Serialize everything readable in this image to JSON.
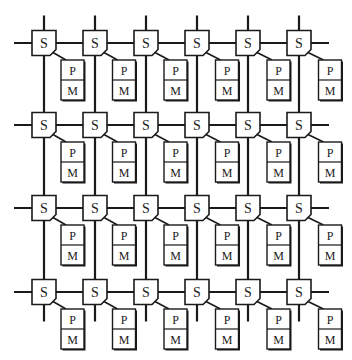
{
  "diagram": {
    "type": "mesh-interconnect",
    "rows": 4,
    "columns": 6,
    "switch_label": "S",
    "processor_label": "P",
    "memory_label": "M",
    "nodes": [
      {
        "row": 1,
        "col": 1,
        "switch": "S",
        "processor": "P",
        "memory": "M"
      },
      {
        "row": 1,
        "col": 2,
        "switch": "S",
        "processor": "P",
        "memory": "M"
      },
      {
        "row": 1,
        "col": 3,
        "switch": "S",
        "processor": "P",
        "memory": "M"
      },
      {
        "row": 1,
        "col": 4,
        "switch": "S",
        "processor": "P",
        "memory": "M"
      },
      {
        "row": 1,
        "col": 5,
        "switch": "S",
        "processor": "P",
        "memory": "M"
      },
      {
        "row": 1,
        "col": 6,
        "switch": "S",
        "processor": "P",
        "memory": "M"
      },
      {
        "row": 2,
        "col": 1,
        "switch": "S",
        "processor": "P",
        "memory": "M"
      },
      {
        "row": 2,
        "col": 2,
        "switch": "S",
        "processor": "P",
        "memory": "M"
      },
      {
        "row": 2,
        "col": 3,
        "switch": "S",
        "processor": "P",
        "memory": "M"
      },
      {
        "row": 2,
        "col": 4,
        "switch": "S",
        "processor": "P",
        "memory": "M"
      },
      {
        "row": 2,
        "col": 5,
        "switch": "S",
        "processor": "P",
        "memory": "M"
      },
      {
        "row": 2,
        "col": 6,
        "switch": "S",
        "processor": "P",
        "memory": "M"
      },
      {
        "row": 3,
        "col": 1,
        "switch": "S",
        "processor": "P",
        "memory": "M"
      },
      {
        "row": 3,
        "col": 2,
        "switch": "S",
        "processor": "P",
        "memory": "M"
      },
      {
        "row": 3,
        "col": 3,
        "switch": "S",
        "processor": "P",
        "memory": "M"
      },
      {
        "row": 3,
        "col": 4,
        "switch": "S",
        "processor": "P",
        "memory": "M"
      },
      {
        "row": 3,
        "col": 5,
        "switch": "S",
        "processor": "P",
        "memory": "M"
      },
      {
        "row": 3,
        "col": 6,
        "switch": "S",
        "processor": "P",
        "memory": "M"
      },
      {
        "row": 4,
        "col": 1,
        "switch": "S",
        "processor": "P",
        "memory": "M"
      },
      {
        "row": 4,
        "col": 2,
        "switch": "S",
        "processor": "P",
        "memory": "M"
      },
      {
        "row": 4,
        "col": 3,
        "switch": "S",
        "processor": "P",
        "memory": "M"
      },
      {
        "row": 4,
        "col": 4,
        "switch": "S",
        "processor": "P",
        "memory": "M"
      },
      {
        "row": 4,
        "col": 5,
        "switch": "S",
        "processor": "P",
        "memory": "M"
      },
      {
        "row": 4,
        "col": 6,
        "switch": "S",
        "processor": "P",
        "memory": "M"
      }
    ],
    "colors": {
      "line": "#1a1a1a",
      "box_fill": "#ffffff",
      "background": "#ffffff"
    }
  }
}
